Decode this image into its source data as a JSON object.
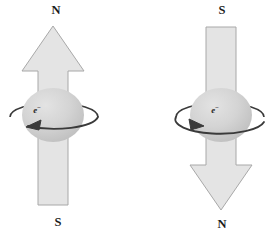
{
  "figure": {
    "width": 270,
    "height": 236,
    "background": "#ffffff"
  },
  "colors": {
    "arrow_fill": "#e4e4e4",
    "arrow_stroke": "#a8a8a8",
    "sphere_fill": "#d2d2d2",
    "sphere_highlight": "#e0e0e0",
    "sphere_shadow": "#bdbdbd",
    "orbit_stroke": "#3a3a3a",
    "label_color": "#1b1b1b",
    "electron_label_color": "#2a2a2a"
  },
  "diagrams": [
    {
      "id": "spin-up",
      "name": "spin-up-electron",
      "top_label": "N",
      "bottom_label": "S",
      "electron_label": "e",
      "electron_charge": "−",
      "arrow_direction": "up",
      "spin_direction": "counterclockwise",
      "orbit_arrow_points": "left",
      "geometry": {
        "arrow_tip_x": 53,
        "arrow_tip_y": 26,
        "head_left_x": 22,
        "head_right_x": 84,
        "head_base_y": 71,
        "shaft_left_x": 38,
        "shaft_right_x": 68,
        "shaft_bottom_y": 205,
        "sphere_cx": 53,
        "sphere_cy": 115,
        "sphere_rx": 31,
        "sphere_ry": 27,
        "orbit_cx": 54,
        "orbit_cy": 117,
        "orbit_rx": 44,
        "orbit_ry": 14,
        "top_label_x": 56,
        "top_label_y": 14,
        "bottom_label_x": 58,
        "bottom_label_y": 226,
        "electron_label_x": 37,
        "electron_label_y": 113
      }
    },
    {
      "id": "spin-down",
      "name": "spin-down-electron",
      "top_label": "S",
      "bottom_label": "N",
      "electron_label": "e",
      "electron_charge": "−",
      "arrow_direction": "down",
      "spin_direction": "clockwise",
      "orbit_arrow_points": "right",
      "geometry": {
        "arrow_tip_x": 221,
        "arrow_tip_y": 210,
        "head_left_x": 190,
        "head_right_x": 252,
        "head_base_y": 165,
        "shaft_left_x": 206,
        "shaft_right_x": 236,
        "shaft_top_y": 27,
        "sphere_cx": 221,
        "sphere_cy": 115,
        "sphere_rx": 31,
        "sphere_ry": 27,
        "orbit_cx": 220,
        "orbit_cy": 117,
        "orbit_rx": 44,
        "orbit_ry": 14,
        "top_label_x": 222,
        "top_label_y": 14,
        "bottom_label_x": 222,
        "bottom_label_y": 228,
        "electron_label_x": 215,
        "electron_label_y": 113
      }
    }
  ]
}
